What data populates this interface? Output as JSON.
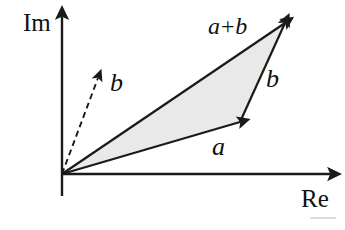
{
  "figure": {
    "background_color": "#ffffff",
    "width": 345,
    "height": 230
  },
  "axes": {
    "imaginary_label": "Im",
    "real_label": "Re",
    "origin": {
      "x": 62,
      "y": 174
    },
    "vertical_top": {
      "x": 62,
      "y": 17
    },
    "vertical_bottom": {
      "x": 62,
      "y": 196
    },
    "horizontal_right": {
      "x": 330,
      "y": 174
    },
    "color": "#1a1a1a",
    "stroke_width": 2.4
  },
  "labels": {
    "a": "a",
    "b_right": "b",
    "b_dashed": "b",
    "a_plus_b": "a+b"
  },
  "vectors": [
    {
      "name": "a",
      "label": "a",
      "style": "solid",
      "from": {
        "x": 62,
        "y": 174
      },
      "to": {
        "x": 240,
        "y": 122
      },
      "color": "#1a1a1a"
    },
    {
      "name": "b-translated",
      "label": "b",
      "style": "solid",
      "from": {
        "x": 240,
        "y": 122
      },
      "to": {
        "x": 285,
        "y": 23
      },
      "color": "#1a1a1a"
    },
    {
      "name": "a-plus-b",
      "label": "a+b",
      "style": "solid",
      "from": {
        "x": 62,
        "y": 174
      },
      "to": {
        "x": 285,
        "y": 23
      },
      "color": "#1a1a1a"
    },
    {
      "name": "b-origin",
      "label": "b",
      "style": "dashed",
      "from": {
        "x": 62,
        "y": 174
      },
      "to": {
        "x": 98,
        "y": 78
      },
      "color": "#1a1a1a"
    }
  ],
  "triangle": {
    "name": "shaded-triangle",
    "points": "62,174 240,122 285,23",
    "fill_color": "#e9e9e9",
    "stroke_color": "#1a1a1a"
  },
  "artifact": {
    "name": "scan-line-artifact",
    "x": 310,
    "y": 218,
    "width": 26,
    "color": "#cfcfcf"
  }
}
